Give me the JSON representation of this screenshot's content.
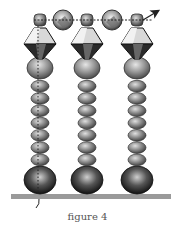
{
  "figure": {
    "caption": "figure 4",
    "columns": 3,
    "small_beads_per_column": 7,
    "colors": {
      "seed_bead": "#8a8a8a",
      "crystal_light": "#d8d8d8",
      "crystal_dark": "#2a2a2a",
      "round_bead": "#9a9a9a",
      "base_bead": "#2e2e2e",
      "table": "#9a9a9a",
      "thread": "#222222"
    },
    "icons": [
      "arrow-right-icon"
    ]
  }
}
